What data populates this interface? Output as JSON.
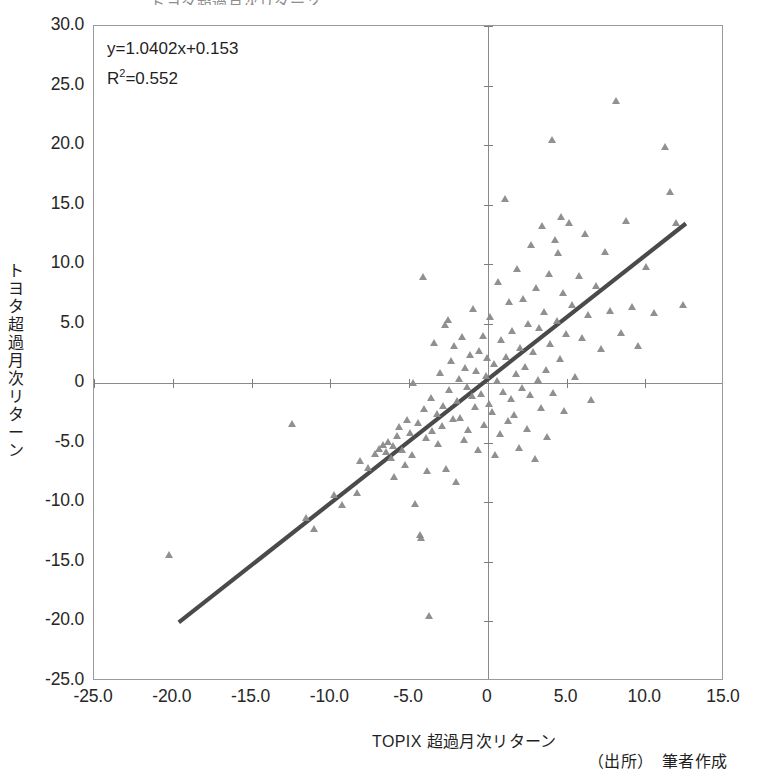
{
  "title": "トヨタ超過月次リターン",
  "equation": {
    "line1": "y=1.0402x+0.153",
    "r2_prefix": "R",
    "r2_exp": "2",
    "r2_value": "=0.552"
  },
  "axis_titles": {
    "y": "トヨタ超過月次リターン",
    "x": "TOPIX 超過月次リターン"
  },
  "source_note": "（出所）　筆者作成",
  "colors": {
    "marker": "#8a8a8a",
    "trendline": "#4a4a4a",
    "axis": "#8a8a8a",
    "frame": "#9a9a9a",
    "text": "#1f1f1f"
  },
  "chart_data": {
    "type": "scatter",
    "title": "トヨタ超過月次リターン",
    "xlabel": "TOPIX 超過月次リターン",
    "ylabel": "トヨタ超過月次リターン",
    "xlim": [
      -25.0,
      15.0
    ],
    "ylim": [
      -25.0,
      30.0
    ],
    "xticks": [
      -25.0,
      -20.0,
      -15.0,
      -10.0,
      -5.0,
      0,
      5.0,
      10.0,
      15.0
    ],
    "xtick_labels": [
      "-25.0",
      "-20.0",
      "-15.0",
      "-10.0",
      "-5.0",
      "0",
      "5.0",
      "10.0",
      "15.0"
    ],
    "yticks": [
      30.0,
      25.0,
      20.0,
      15.0,
      10.0,
      5.0,
      0,
      -5.0,
      -10.0,
      -15.0,
      -20.0,
      -25.0
    ],
    "ytick_labels": [
      "30.0",
      "25.0",
      "20.0",
      "15.0",
      "10.0",
      "5.0",
      "0",
      "-5.0",
      "-10.0",
      "-15.0",
      "-20.0",
      "-25.0"
    ],
    "grid": false,
    "legend": false,
    "marker": "triangle",
    "annotations": [
      "y=1.0402x+0.153",
      "R2=0.552"
    ],
    "trendline": {
      "type": "linear",
      "slope": 1.0402,
      "intercept": 0.153,
      "r_squared": 0.552,
      "x_start": -19.6,
      "x_end": 12.7
    },
    "points": [
      [
        -20.2,
        -14.4
      ],
      [
        -12.4,
        -3.4
      ],
      [
        -11.5,
        -11.3
      ],
      [
        -11.0,
        -12.2
      ],
      [
        -9.7,
        -9.4
      ],
      [
        -9.2,
        -10.2
      ],
      [
        -8.3,
        -9.2
      ],
      [
        -8.1,
        -6.5
      ],
      [
        -7.6,
        -7.1
      ],
      [
        -7.1,
        -5.9
      ],
      [
        -6.9,
        -5.5
      ],
      [
        -6.6,
        -5.2
      ],
      [
        -6.4,
        -5.8
      ],
      [
        -6.3,
        -4.9
      ],
      [
        -6.1,
        -6.3
      ],
      [
        -6.0,
        -5.3
      ],
      [
        -5.9,
        -7.9
      ],
      [
        -5.7,
        -4.4
      ],
      [
        -5.6,
        -3.7
      ],
      [
        -5.4,
        -5.6
      ],
      [
        -5.2,
        -6.9
      ],
      [
        -5.1,
        -3.1
      ],
      [
        -4.9,
        -4.2
      ],
      [
        -4.8,
        -6.0
      ],
      [
        -4.7,
        0.0
      ],
      [
        -4.6,
        -10.1
      ],
      [
        -4.4,
        -3.3
      ],
      [
        -4.3,
        -12.7
      ],
      [
        -4.2,
        -13.0
      ],
      [
        -4.1,
        8.9
      ],
      [
        -4.0,
        -2.2
      ],
      [
        -3.9,
        -4.6
      ],
      [
        -3.8,
        -7.4
      ],
      [
        -3.7,
        -19.5
      ],
      [
        -3.6,
        -1.2
      ],
      [
        -3.5,
        -4.0
      ],
      [
        -3.4,
        3.4
      ],
      [
        -3.2,
        -2.6
      ],
      [
        -3.1,
        -5.1
      ],
      [
        -3.0,
        0.9
      ],
      [
        -2.9,
        -3.6
      ],
      [
        -2.8,
        -1.9
      ],
      [
        -2.7,
        4.9
      ],
      [
        -2.6,
        -7.2
      ],
      [
        -2.5,
        5.3
      ],
      [
        -2.4,
        -0.6
      ],
      [
        -2.3,
        1.9
      ],
      [
        -2.2,
        -3.0
      ],
      [
        -2.1,
        3.1
      ],
      [
        -2.0,
        -8.3
      ],
      [
        -1.9,
        -1.5
      ],
      [
        -1.8,
        0.4
      ],
      [
        -1.7,
        -2.9
      ],
      [
        -1.6,
        3.9
      ],
      [
        -1.5,
        -4.8
      ],
      [
        -1.4,
        1.3
      ],
      [
        -1.3,
        -0.3
      ],
      [
        -1.2,
        -3.9
      ],
      [
        -1.1,
        2.4
      ],
      [
        -1.0,
        -1.1
      ],
      [
        -0.9,
        6.2
      ],
      [
        -0.8,
        -2.0
      ],
      [
        -0.7,
        1.0
      ],
      [
        -0.6,
        -5.6
      ],
      [
        -0.5,
        2.7
      ],
      [
        -0.4,
        -0.9
      ],
      [
        -0.3,
        4.0
      ],
      [
        -0.2,
        -3.5
      ],
      [
        -0.1,
        0.6
      ],
      [
        0.0,
        2.1
      ],
      [
        0.1,
        -1.7
      ],
      [
        0.2,
        5.6
      ],
      [
        0.3,
        -2.4
      ],
      [
        0.4,
        1.6
      ],
      [
        0.5,
        -6.0
      ],
      [
        0.6,
        0.2
      ],
      [
        0.7,
        8.5
      ],
      [
        0.8,
        -4.3
      ],
      [
        0.9,
        3.6
      ],
      [
        1.0,
        -0.7
      ],
      [
        1.1,
        15.5
      ],
      [
        1.2,
        2.2
      ],
      [
        1.3,
        -3.2
      ],
      [
        1.4,
        6.8
      ],
      [
        1.5,
        -1.3
      ],
      [
        1.6,
        4.4
      ],
      [
        1.7,
        -2.7
      ],
      [
        1.8,
        0.8
      ],
      [
        1.9,
        9.6
      ],
      [
        2.0,
        -5.4
      ],
      [
        2.1,
        3.0
      ],
      [
        2.2,
        -0.4
      ],
      [
        2.3,
        7.1
      ],
      [
        2.4,
        1.4
      ],
      [
        2.5,
        -3.8
      ],
      [
        2.6,
        5.0
      ],
      [
        2.7,
        -1.0
      ],
      [
        2.8,
        11.6
      ],
      [
        2.9,
        2.6
      ],
      [
        3.0,
        -6.4
      ],
      [
        3.1,
        8.0
      ],
      [
        3.2,
        0.3
      ],
      [
        3.3,
        4.6
      ],
      [
        3.4,
        -2.1
      ],
      [
        3.5,
        13.2
      ],
      [
        3.6,
        6.0
      ],
      [
        3.7,
        1.1
      ],
      [
        3.8,
        -4.5
      ],
      [
        3.9,
        9.2
      ],
      [
        4.0,
        3.3
      ],
      [
        4.1,
        20.4
      ],
      [
        4.2,
        -0.8
      ],
      [
        4.3,
        12.0
      ],
      [
        4.4,
        5.2
      ],
      [
        4.5,
        10.9
      ],
      [
        4.6,
        2.0
      ],
      [
        4.7,
        14.0
      ],
      [
        4.8,
        7.6
      ],
      [
        4.9,
        -2.3
      ],
      [
        5.0,
        4.1
      ],
      [
        5.2,
        13.5
      ],
      [
        5.4,
        6.6
      ],
      [
        5.6,
        0.5
      ],
      [
        5.8,
        9.0
      ],
      [
        6.0,
        3.8
      ],
      [
        6.2,
        12.5
      ],
      [
        6.4,
        5.7
      ],
      [
        6.6,
        -1.4
      ],
      [
        6.9,
        8.2
      ],
      [
        7.2,
        2.9
      ],
      [
        7.5,
        11.0
      ],
      [
        7.8,
        6.1
      ],
      [
        8.2,
        23.7
      ],
      [
        8.5,
        4.2
      ],
      [
        8.8,
        13.6
      ],
      [
        9.2,
        6.4
      ],
      [
        9.6,
        3.1
      ],
      [
        10.1,
        9.8
      ],
      [
        10.6,
        5.9
      ],
      [
        11.3,
        19.8
      ],
      [
        11.6,
        16.1
      ],
      [
        12.0,
        13.5
      ],
      [
        12.4,
        6.6
      ]
    ]
  }
}
